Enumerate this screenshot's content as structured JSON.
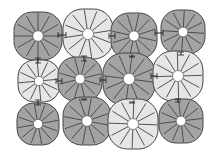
{
  "diagram": {
    "type": "segmented-cell-grid",
    "rows": 3,
    "cols": 4,
    "colors": {
      "background": "#ffffff",
      "dark_fill": "#a3a3a3",
      "light_fill": "#e6e6e6",
      "stroke": "#444444",
      "hole": "#ffffff",
      "connector": "#222222"
    },
    "cells": [
      {
        "id": "r1c1",
        "cx": 38,
        "cy": 36,
        "r": 24,
        "shade": "dark",
        "segments": 12
      },
      {
        "id": "r1c2",
        "cx": 88,
        "cy": 34,
        "r": 25,
        "shade": "light",
        "segments": 12
      },
      {
        "id": "r1c3",
        "cx": 134,
        "cy": 36,
        "r": 23,
        "shade": "dark",
        "segments": 12
      },
      {
        "id": "r1c4",
        "cx": 183,
        "cy": 32,
        "r": 22,
        "shade": "dark",
        "segments": 12
      },
      {
        "id": "r2c1",
        "cx": 39,
        "cy": 81,
        "r": 21,
        "shade": "light",
        "segments": 12
      },
      {
        "id": "r2c2",
        "cx": 80,
        "cy": 79,
        "r": 22,
        "shade": "dark",
        "segments": 12
      },
      {
        "id": "r2c3",
        "cx": 129,
        "cy": 79,
        "r": 26,
        "shade": "dark",
        "segments": 12
      },
      {
        "id": "r2c4",
        "cx": 178,
        "cy": 76,
        "r": 25,
        "shade": "light",
        "segments": 12
      },
      {
        "id": "r3c1",
        "cx": 38,
        "cy": 124,
        "r": 21,
        "shade": "dark",
        "segments": 12
      },
      {
        "id": "r3c2",
        "cx": 87,
        "cy": 121,
        "r": 24,
        "shade": "dark",
        "segments": 12
      },
      {
        "id": "r3c3",
        "cx": 133,
        "cy": 124,
        "r": 25,
        "shade": "light",
        "segments": 12
      },
      {
        "id": "r3c4",
        "cx": 181,
        "cy": 121,
        "r": 22,
        "shade": "dark",
        "segments": 12
      }
    ],
    "connectors": [
      {
        "x1": 58,
        "y1": 35,
        "x2": 66,
        "y2": 35
      },
      {
        "x1": 109,
        "y1": 36,
        "x2": 115,
        "y2": 36
      },
      {
        "x1": 155,
        "y1": 33,
        "x2": 163,
        "y2": 33
      },
      {
        "x1": 56,
        "y1": 81,
        "x2": 62,
        "y2": 81
      },
      {
        "x1": 100,
        "y1": 80,
        "x2": 106,
        "y2": 80
      },
      {
        "x1": 151,
        "y1": 76,
        "x2": 157,
        "y2": 76
      },
      {
        "x1": 38,
        "y1": 58,
        "x2": 38,
        "y2": 63
      },
      {
        "x1": 84,
        "y1": 56,
        "x2": 84,
        "y2": 61
      },
      {
        "x1": 132,
        "y1": 57,
        "x2": 132,
        "y2": 56
      },
      {
        "x1": 181,
        "y1": 52,
        "x2": 181,
        "y2": 55
      },
      {
        "x1": 38,
        "y1": 100,
        "x2": 38,
        "y2": 105
      },
      {
        "x1": 84,
        "y1": 99,
        "x2": 84,
        "y2": 100
      },
      {
        "x1": 132,
        "y1": 102,
        "x2": 132,
        "y2": 103
      },
      {
        "x1": 178,
        "y1": 99,
        "x2": 178,
        "y2": 102
      }
    ]
  }
}
